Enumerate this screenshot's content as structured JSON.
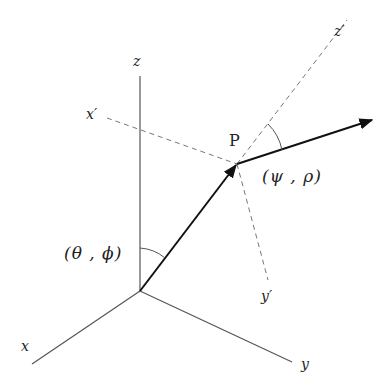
{
  "diagram": {
    "labels": {
      "z": "z",
      "x": "x",
      "y": "y",
      "x_prime": "x′",
      "y_prime": "y′",
      "z_prime": "z′",
      "point": "P",
      "incident_angles": "(θ , ϕ)",
      "scattered_angles": "(ψ , ρ)"
    },
    "colors": {
      "axis": "#555555",
      "dashed": "#777777",
      "vector": "#111111",
      "text": "#222222"
    }
  }
}
